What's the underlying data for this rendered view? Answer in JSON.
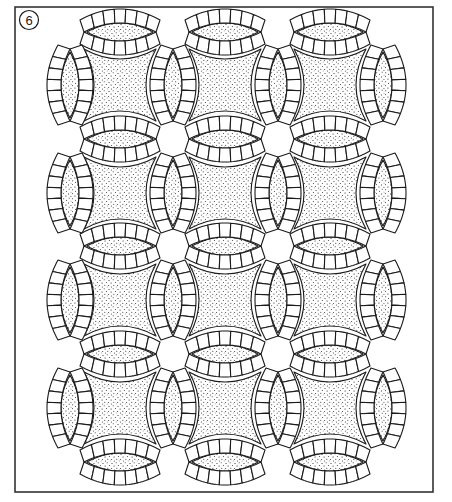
{
  "figure": {
    "label": "6",
    "frame": {
      "x": 15,
      "y": 7,
      "width": 418,
      "height": 485
    },
    "colors": {
      "line": "#1a1a1a",
      "background": "#ffffff",
      "stipple": "#222222"
    }
  },
  "layout": {
    "columns": 3,
    "rows": 4,
    "square_centers_x": [
      120,
      225,
      330
    ],
    "square_centers_y": [
      85,
      193,
      300,
      408
    ],
    "horizontal_melon_y": [
      32,
      139,
      246,
      354,
      462
    ],
    "vertical_melon_x": [
      70,
      173,
      278,
      383
    ],
    "segments_per_arc": 7
  },
  "blocks": [
    {
      "row": 0,
      "col": 0,
      "type": "ring"
    },
    {
      "row": 0,
      "col": 1,
      "type": "plain"
    },
    {
      "row": 0,
      "col": 2,
      "type": "ring"
    },
    {
      "row": 1,
      "col": 0,
      "type": "plain"
    },
    {
      "row": 1,
      "col": 1,
      "type": "ring"
    },
    {
      "row": 1,
      "col": 2,
      "type": "plain"
    },
    {
      "row": 2,
      "col": 0,
      "type": "ring"
    },
    {
      "row": 2,
      "col": 1,
      "type": "plain"
    },
    {
      "row": 2,
      "col": 2,
      "type": "ring"
    },
    {
      "row": 3,
      "col": 0,
      "type": "plain"
    },
    {
      "row": 3,
      "col": 1,
      "type": "ring"
    },
    {
      "row": 3,
      "col": 2,
      "type": "plain"
    }
  ]
}
